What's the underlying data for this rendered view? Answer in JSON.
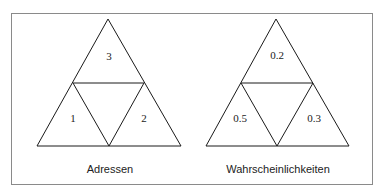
{
  "diagrams": [
    {
      "caption": "Adressen",
      "cells": {
        "top": "3",
        "left": "1",
        "right": "2"
      }
    },
    {
      "caption": "Wahrscheinlichkeiten",
      "cells": {
        "top": "0.2",
        "left": "0.5",
        "right": "0.3"
      }
    }
  ],
  "colors": {
    "stroke": "#1a1a1a",
    "frame": "#8a8a8a",
    "background": "#ffffff"
  }
}
